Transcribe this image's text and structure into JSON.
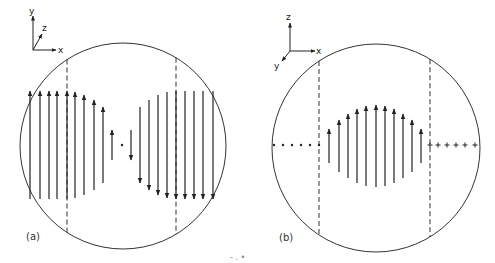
{
  "figure": {
    "panels": [
      {
        "id": "a",
        "caption": "(a)",
        "axes": {
          "up": "y",
          "diagonal": "z",
          "right": "x"
        },
        "circle": {
          "cx": 123,
          "cy": 146,
          "r": 103
        },
        "dashed_lines_x": [
          67,
          176
        ],
        "arrow_baseline_y": 145,
        "arrows": [
          {
            "x": 30,
            "len": 72
          },
          {
            "x": 40,
            "len": 72
          },
          {
            "x": 49,
            "len": 72
          },
          {
            "x": 57,
            "len": 72
          },
          {
            "x": 67,
            "len": 72
          },
          {
            "x": 75,
            "len": 70
          },
          {
            "x": 84,
            "len": 64
          },
          {
            "x": 94,
            "len": 54
          },
          {
            "x": 103,
            "len": 40
          },
          {
            "x": 112,
            "len": 22
          },
          {
            "x": 122,
            "len": 0
          },
          {
            "x": 131,
            "len": -22
          },
          {
            "x": 140,
            "len": -40
          },
          {
            "x": 149,
            "len": -54
          },
          {
            "x": 158,
            "len": -64
          },
          {
            "x": 167,
            "len": -70
          },
          {
            "x": 176,
            "len": -72
          },
          {
            "x": 185,
            "len": -72
          },
          {
            "x": 194,
            "len": -72
          },
          {
            "x": 203,
            "len": -72
          },
          {
            "x": 213,
            "len": -72
          }
        ]
      },
      {
        "id": "b",
        "caption": "(b)",
        "axes": {
          "up": "z",
          "diagonal": "y",
          "right": "x"
        },
        "circle": {
          "cx": 376,
          "cy": 148,
          "r": 104
        },
        "dashed_lines_x": [
          319,
          430
        ],
        "baseline_y": 145,
        "left_markers": "dots",
        "right_markers": "plus",
        "left_marker_x": [
          274,
          283,
          292,
          301,
          310,
          319
        ],
        "right_marker_x": [
          430,
          438,
          447,
          456,
          465,
          475
        ],
        "arrows": [
          {
            "x": 329,
            "len": 14
          },
          {
            "x": 339,
            "len": 32
          },
          {
            "x": 348,
            "len": 44
          },
          {
            "x": 357,
            "len": 54
          },
          {
            "x": 366,
            "len": 60
          },
          {
            "x": 376,
            "len": 62
          },
          {
            "x": 385,
            "len": 60
          },
          {
            "x": 394,
            "len": 54
          },
          {
            "x": 403,
            "len": 44
          },
          {
            "x": 412,
            "len": 32
          },
          {
            "x": 421,
            "len": 14
          }
        ]
      }
    ],
    "stray_marks": "- . •"
  }
}
